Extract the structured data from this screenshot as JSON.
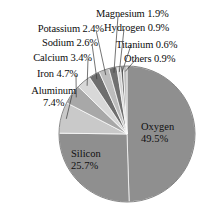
{
  "chart_data": {
    "type": "pie",
    "title": "",
    "subtitle": "",
    "xlabel": "",
    "ylabel": "",
    "legend_position": "none",
    "grid": false,
    "unit": "%",
    "start_angle_deg": 0,
    "direction": "clockwise",
    "categories": [
      "Oxygen",
      "Silicon",
      "Aluminum",
      "Iron",
      "Calcium",
      "Sodium",
      "Potassium",
      "Magnesium",
      "Hydrogen",
      "Titanium",
      "Others"
    ],
    "values": [
      49.5,
      25.7,
      7.4,
      4.7,
      3.4,
      2.6,
      2.4,
      1.9,
      0.9,
      0.6,
      0.9
    ],
    "slices": [
      {
        "name": "Oxygen",
        "value": 49.5,
        "label": "Oxygen",
        "value_label": "49.5%",
        "color": "#8f8f8f",
        "placement": "inside"
      },
      {
        "name": "Silicon",
        "value": 25.7,
        "label": "Silicon",
        "value_label": "25.7%",
        "color": "#8f8f8f",
        "placement": "inside"
      },
      {
        "name": "Aluminum",
        "value": 7.4,
        "label": "Aluminum",
        "value_label": "7.4%",
        "color": "#c9c9c9",
        "placement": "callout-left"
      },
      {
        "name": "Iron",
        "value": 4.7,
        "label": "Iron",
        "value_label": "4.7%",
        "color": "#a8a8a8",
        "placement": "callout-left"
      },
      {
        "name": "Calcium",
        "value": 3.4,
        "label": "Calcium",
        "value_label": "3.4%",
        "color": "#d8d8d8",
        "placement": "callout-left"
      },
      {
        "name": "Sodium",
        "value": 2.6,
        "label": "Sodium",
        "value_label": "2.6%",
        "color": "#6e6e6e",
        "placement": "callout-left"
      },
      {
        "name": "Potassium",
        "value": 2.4,
        "label": "Potassium",
        "value_label": "2.4%",
        "color": "#bdbdbd",
        "placement": "callout-left"
      },
      {
        "name": "Magnesium",
        "value": 1.9,
        "label": "Magnesium",
        "value_label": "1.9%",
        "color": "#707070",
        "placement": "callout-right"
      },
      {
        "name": "Hydrogen",
        "value": 0.9,
        "label": "Hydrogen",
        "value_label": "0.9%",
        "color": "#d2d2d2",
        "placement": "callout-right"
      },
      {
        "name": "Titanium",
        "value": 0.6,
        "label": "Titanium",
        "value_label": "0.6%",
        "color": "#5f5f5f",
        "placement": "callout-right"
      },
      {
        "name": "Others",
        "value": 0.9,
        "label": "Others",
        "value_label": "0.9%",
        "color": "#bfbfbf",
        "placement": "callout-right"
      }
    ]
  },
  "labels": {
    "magnesium": "Magnesium 1.9%",
    "hydrogen": "Hydrogen 0.9%",
    "titanium": "Titanium 0.6%",
    "others": "Others 0.9%",
    "potassium": "Potassium 2.4%",
    "sodium": "Sodium 2.6%",
    "calcium": "Calcium 3.4%",
    "iron": "Iron 4.7%",
    "aluminum_name": "Aluminum",
    "aluminum_value": "7.4%",
    "oxygen_name": "Oxygen",
    "oxygen_value": "49.5%",
    "silicon_name": "Silicon",
    "silicon_value": "25.7%"
  },
  "style": {
    "background": "#ffffff",
    "text_color": "#0d0d0d",
    "slice_outline": "#ffffff",
    "leader_line": "#3a3a3a"
  },
  "geometry": {
    "center_x": 127,
    "center_y": 134,
    "radius": 68
  }
}
